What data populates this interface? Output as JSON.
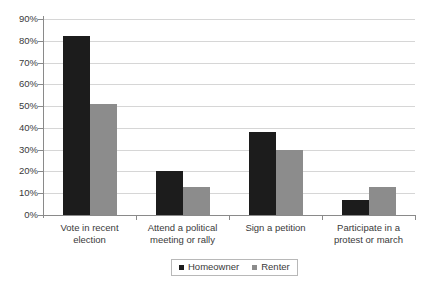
{
  "chart_data": {
    "type": "bar",
    "title": "",
    "subtitle": "",
    "xlabel": "",
    "ylabel": "",
    "ylim": [
      0,
      90
    ],
    "ytick_step": 10,
    "grid": true,
    "legend_position": "bottom",
    "categories": [
      "Vote in recent election",
      "Attend a political meeting or rally",
      "Sign a petition",
      "Participate in a protest or march"
    ],
    "category_lines": [
      [
        "Vote in recent",
        "election"
      ],
      [
        "Attend a political",
        "meeting or rally"
      ],
      [
        "Sign a petition",
        ""
      ],
      [
        "Participate in a",
        "protest or march"
      ]
    ],
    "series": [
      {
        "name": "Homeowner",
        "color": "#1c1c1c",
        "values": [
          82,
          20,
          38,
          7
        ]
      },
      {
        "name": "Renter",
        "color": "#8c8c8c",
        "values": [
          51,
          13,
          30,
          13
        ]
      }
    ],
    "ytick_labels": [
      "90%",
      "80%",
      "70%",
      "60%",
      "50%",
      "40%",
      "30%",
      "20%",
      "10%",
      "0%"
    ],
    "ytick_values": [
      90,
      80,
      70,
      60,
      50,
      40,
      30,
      20,
      10,
      0
    ]
  },
  "legend": {
    "items": [
      {
        "label": "Homeowner"
      },
      {
        "label": "Renter"
      }
    ]
  },
  "colors": {
    "homeowner": "#1c1c1c",
    "renter": "#8c8c8c",
    "gridline": "#d6d6d6",
    "axis": "#8a8a8a",
    "text": "#3a3a3a",
    "background": "#ffffff"
  }
}
